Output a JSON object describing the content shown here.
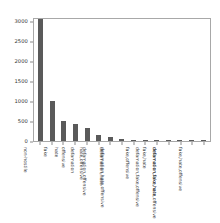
{
  "chart_data": {
    "type": "bar",
    "title": "",
    "xlabel": "",
    "ylabel": "",
    "ylim": [
      0,
      3100
    ],
    "yticks": [
      0,
      500,
      1000,
      1500,
      2000,
      2500,
      3000
    ],
    "ytick_labels": [
      "0",
      "500",
      "1000",
      "1500",
      "2000",
      "2500",
      "3000"
    ],
    "grid": false,
    "legend": null,
    "bar_color": "#5a5a5a",
    "categories": [
      "non-hostile",
      "fake",
      "hate",
      "offensive",
      "defamation",
      "hate,offensive",
      "defamation,offensive",
      "defamation,hate",
      "defamation,hate,offensive",
      "fake,offensive",
      "fake,hate",
      "defamation,fake,offensive",
      "defamation,fake,hate",
      "defamation,fake,hate,offensive",
      "fake,hate,offensive"
    ],
    "values": [
      3050,
      1000,
      500,
      430,
      330,
      150,
      90,
      50,
      35,
      25,
      18,
      14,
      10,
      8,
      5
    ]
  }
}
